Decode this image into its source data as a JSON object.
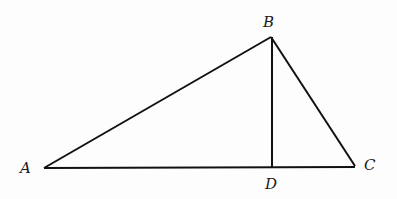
{
  "diagram": {
    "type": "triangle-with-altitude",
    "stroke_color": "#111111",
    "points": {
      "A": {
        "label": "A",
        "x": 44,
        "y": 168,
        "label_x": 20,
        "label_y": 173
      },
      "B": {
        "label": "B",
        "x": 271,
        "y": 37,
        "label_x": 263,
        "label_y": 27
      },
      "C": {
        "label": "C",
        "x": 355,
        "y": 166,
        "label_x": 364,
        "label_y": 170
      },
      "D": {
        "label": "D",
        "x": 272,
        "y": 168,
        "label_x": 265,
        "label_y": 189
      }
    },
    "segments": [
      {
        "from": "A",
        "to": "B"
      },
      {
        "from": "B",
        "to": "C"
      },
      {
        "from": "A",
        "to": "C"
      },
      {
        "from": "B",
        "to": "D"
      }
    ]
  }
}
